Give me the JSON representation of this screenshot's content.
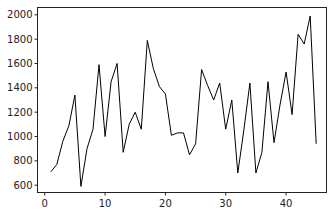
{
  "chart_data": {
    "type": "line",
    "title": "",
    "xlabel": "",
    "ylabel": "",
    "x": [
      1,
      2,
      3,
      4,
      5,
      6,
      7,
      8,
      9,
      10,
      11,
      12,
      13,
      14,
      15,
      16,
      17,
      18,
      19,
      20,
      21,
      22,
      23,
      24,
      25,
      26,
      27,
      28,
      29,
      30,
      31,
      32,
      33,
      34,
      35,
      36,
      37,
      38,
      39,
      40,
      41,
      42,
      43,
      44,
      45
    ],
    "series": [
      {
        "name": "series",
        "color": "#000000",
        "values": [
          710,
          770,
          960,
          1090,
          1340,
          590,
          900,
          1060,
          1590,
          1000,
          1450,
          1600,
          870,
          1100,
          1200,
          1060,
          1790,
          1560,
          1410,
          1350,
          1010,
          1030,
          1030,
          850,
          940,
          1550,
          1420,
          1300,
          1440,
          1060,
          1300,
          700,
          1050,
          1440,
          700,
          870,
          1450,
          950,
          1260,
          1530,
          1180,
          1840,
          1760,
          1990,
          940
        ]
      }
    ],
    "xlim": [
      -1.2,
      46.7
    ],
    "ylim": [
      540,
      2060
    ],
    "xticks": [
      0,
      10,
      20,
      30,
      40
    ],
    "yticks": [
      600,
      800,
      1000,
      1200,
      1400,
      1600,
      1800,
      2000
    ],
    "xtick_labels": [
      "0",
      "10",
      "20",
      "30",
      "40"
    ],
    "ytick_labels": [
      "600",
      "800",
      "1000",
      "1200",
      "1400",
      "1600",
      "1800",
      "2000"
    ],
    "grid": false,
    "legend": null
  }
}
